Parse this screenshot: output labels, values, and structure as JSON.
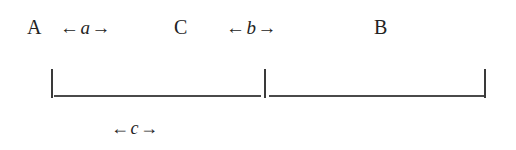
{
  "figure": {
    "type": "measurement-diagram",
    "background_color": "#ffffff",
    "ink_color": "#232323",
    "line_color": "#4a4a4a"
  },
  "points": {
    "a_label": "A",
    "c_label": "C",
    "b_label": "B"
  },
  "spans": {
    "a": {
      "left_arrow": "←",
      "variable": "a",
      "right_arrow": "→"
    },
    "b": {
      "left_arrow": "←",
      "variable": "b",
      "right_arrow": "→"
    },
    "c": {
      "left_arrow": "←",
      "variable": "c",
      "right_arrow": "→"
    }
  },
  "ruler": {
    "tick_count": 3,
    "segments": [
      {
        "name": "segment-a",
        "from": "A",
        "to": "C"
      },
      {
        "name": "segment-b",
        "from": "C",
        "to": "B"
      }
    ]
  }
}
